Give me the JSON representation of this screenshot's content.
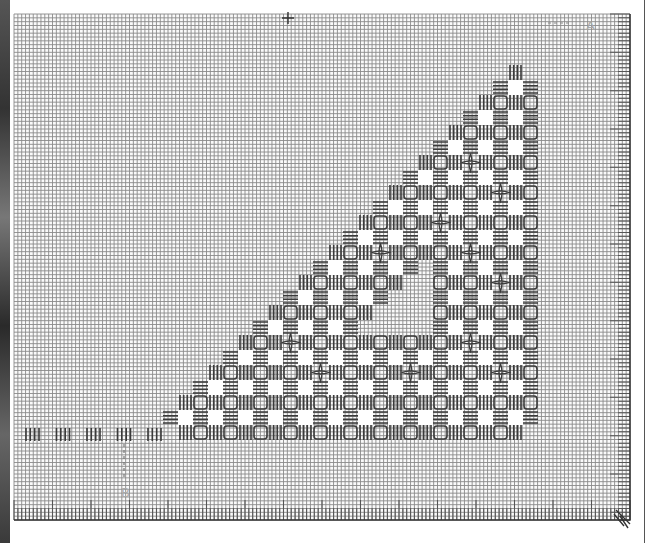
{
  "chart_data": {
    "type": "pattern-grid",
    "grid": {
      "columns": 160,
      "rows": 132,
      "major_every": 10
    },
    "motif": {
      "shape": "right-triangle",
      "orientation": "right-angle at bottom-right",
      "rows_of_cut_squares": 12,
      "cut_squares_per_row": [
        1,
        2,
        3,
        4,
        5,
        6,
        7,
        8,
        9,
        10,
        11,
        12
      ],
      "unstitched_inner_holes": [
        {
          "row": 6,
          "positions": [
            3
          ]
        },
        {
          "row": 7,
          "positions": [
            3,
            4
          ]
        },
        {
          "row": 8,
          "positions": [
            3,
            4,
            5
          ]
        }
      ],
      "elements": [
        "kloster-block",
        "cut-square",
        "woven-bar",
        "dove-eye",
        "framed-square"
      ],
      "dove_eye_rows": [
        2,
        3,
        4,
        5,
        6,
        7,
        8,
        9,
        10
      ]
    },
    "border_row": {
      "kloster_groups_left_of_motif": 5
    },
    "markers": [
      {
        "label": "A",
        "location": "top-right"
      },
      {
        "label": "B",
        "location": "bottom-left"
      }
    ],
    "center_marks": [
      "top",
      "bottom-right-arrow"
    ]
  },
  "colors": {
    "grid": "#8a8a8a",
    "grid_major": "#555555",
    "stitch": "#3a3a3a",
    "cut": "#ffffff",
    "background": "#ffffff"
  }
}
